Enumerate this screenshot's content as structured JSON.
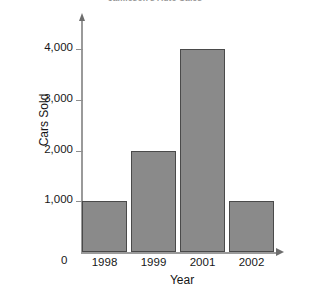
{
  "chart_data": {
    "type": "bar",
    "title": "Jamieson's Auto Sales",
    "xlabel": "Year",
    "ylabel": "Cars Sold",
    "categories": [
      "1998",
      "1999",
      "2001",
      "2002"
    ],
    "values": [
      1000,
      2000,
      4000,
      1000
    ],
    "ytick_labels": [
      "1,000",
      "2,000",
      "3,000",
      "4,000"
    ],
    "ytick_values": [
      1000,
      2000,
      3000,
      4000
    ],
    "origin_label": "0",
    "ylim": [
      0,
      4600
    ],
    "grid": false,
    "legend": null,
    "bar_color": "#8a8a8a",
    "bar_border_color": "#4a4a4a",
    "axis_color": "#9a9a9a",
    "background": "#ffffff"
  }
}
